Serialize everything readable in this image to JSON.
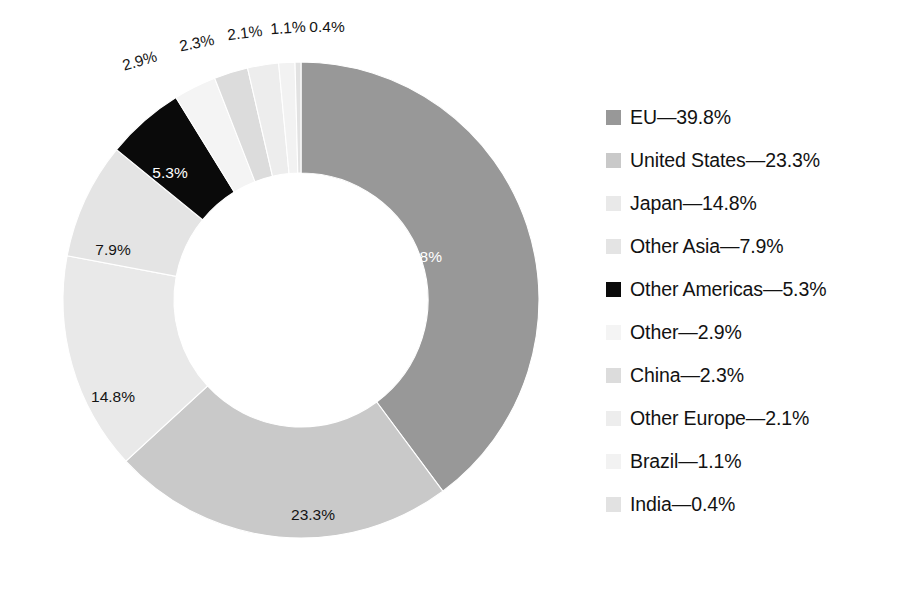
{
  "chart_data": {
    "type": "pie",
    "variant": "donut",
    "title": "",
    "subtitle": "",
    "xlabel": "",
    "ylabel": "",
    "units": "percent",
    "grid": false,
    "legend_position": "right",
    "label_format": "{value}%",
    "legend_format": "{name}—{value}%",
    "start_angle_deg": 0,
    "direction": "clockwise",
    "categories": [
      "EU",
      "United States",
      "Japan",
      "Other Asia",
      "Other Americas",
      "Other",
      "China",
      "Other Europe",
      "Brazil",
      "India"
    ],
    "values": [
      39.8,
      23.3,
      14.8,
      7.9,
      5.3,
      2.9,
      2.3,
      2.1,
      1.1,
      0.4
    ],
    "colors": [
      "#989898",
      "#c9c9c9",
      "#e9e9e9",
      "#e4e4e4",
      "#0a0a0a",
      "#f4f4f4",
      "#dcdcdc",
      "#ededed",
      "#f2f2f2",
      "#e2e2e2"
    ],
    "slices": [
      {
        "name": "EU",
        "value": 39.8,
        "label": "39.8%",
        "legend": "EU—39.8%",
        "color": "#989898",
        "label_color": "#ffffff",
        "label_inside": true,
        "lx": 420,
        "ly": 258,
        "rot": 0
      },
      {
        "name": "United States",
        "value": 23.3,
        "label": "23.3%",
        "legend": "United States—23.3%",
        "color": "#c9c9c9",
        "label_color": "#141414",
        "label_inside": true,
        "lx": 313,
        "ly": 516,
        "rot": 0
      },
      {
        "name": "Japan",
        "value": 14.8,
        "label": "14.8%",
        "legend": "Japan—14.8%",
        "color": "#e9e9e9",
        "label_color": "#141414",
        "label_inside": true,
        "lx": 113,
        "ly": 398,
        "rot": 0
      },
      {
        "name": "Other Asia",
        "value": 7.9,
        "label": "7.9%",
        "legend": "Other Asia—7.9%",
        "color": "#e4e4e4",
        "label_color": "#141414",
        "label_inside": true,
        "lx": 113,
        "ly": 251,
        "rot": 0
      },
      {
        "name": "Other Americas",
        "value": 5.3,
        "label": "5.3%",
        "legend": "Other Americas—5.3%",
        "color": "#0a0a0a",
        "label_color": "#ffffff",
        "label_inside": true,
        "lx": 170,
        "ly": 174,
        "rot": 0
      },
      {
        "name": "Other",
        "value": 2.9,
        "label": "2.9%",
        "legend": "Other—2.9%",
        "color": "#f4f4f4",
        "label_color": "#141414",
        "label_inside": false,
        "lx": 140,
        "ly": 62,
        "rot": -16
      },
      {
        "name": "China",
        "value": 2.3,
        "label": "2.3%",
        "legend": "China—2.3%",
        "color": "#dcdcdc",
        "label_color": "#141414",
        "label_inside": false,
        "lx": 197,
        "ly": 44,
        "rot": -11
      },
      {
        "name": "Other Europe",
        "value": 2.1,
        "label": "2.1%",
        "legend": "Other Europe—2.1%",
        "color": "#ededed",
        "label_color": "#141414",
        "label_inside": false,
        "lx": 245,
        "ly": 34,
        "rot": -7
      },
      {
        "name": "Brazil",
        "value": 1.1,
        "label": "1.1%",
        "legend": "Brazil—1.1%",
        "color": "#f2f2f2",
        "label_color": "#141414",
        "label_inside": false,
        "lx": 288,
        "ly": 29,
        "rot": -4
      },
      {
        "name": "India",
        "value": 0.4,
        "label": "0.4%",
        "legend": "India—0.4%",
        "color": "#e2e2e2",
        "label_color": "#141414",
        "label_inside": false,
        "lx": 327,
        "ly": 28,
        "rot": 0
      }
    ],
    "geometry": {
      "cx": 301,
      "cy": 300,
      "outer_radius": 238,
      "inner_radius": 127
    }
  }
}
